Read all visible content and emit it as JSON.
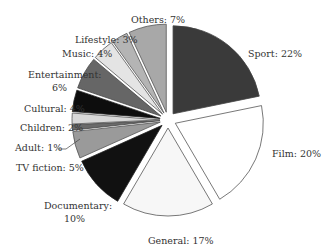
{
  "chart_data": {
    "type": "pie",
    "title": "",
    "exploded": true,
    "start_angle_deg": 0,
    "direction": "clockwise",
    "slices": [
      {
        "label": "Sport",
        "value": 22,
        "text": "Sport: 22%",
        "color": "#3a3a3a",
        "stroke": "#444444"
      },
      {
        "label": "Film",
        "value": 20,
        "text": "Film: 20%",
        "color": "#ffffff",
        "stroke": "#555555"
      },
      {
        "label": "General",
        "value": 17,
        "text": "General: 17%",
        "color": "#f7f7f7",
        "stroke": "#555555"
      },
      {
        "label": "Documentary",
        "value": 10,
        "text": "Documentary: 10%",
        "color": "#111111",
        "stroke": "#222222"
      },
      {
        "label": "TV fiction",
        "value": 5,
        "text": "TV fiction: 5%",
        "color": "#9a9a9a",
        "stroke": "#555555"
      },
      {
        "label": "Adult",
        "value": 1,
        "text": "Adult: 1%",
        "color": "#6a6a6a",
        "stroke": "#444444"
      },
      {
        "label": "Children",
        "value": 2,
        "text": "Children: 2%",
        "color": "#d8d8d8",
        "stroke": "#555555"
      },
      {
        "label": "Cultural",
        "value": 4,
        "text": "Cultural: 4%",
        "color": "#0d0d0d",
        "stroke": "#222222"
      },
      {
        "label": "Entertainment",
        "value": 6,
        "text": "Entertainment: 6%",
        "color": "#666666",
        "stroke": "#444444"
      },
      {
        "label": "Music",
        "value": 4,
        "text": "Music: 4%",
        "color": "#e4e4e4",
        "stroke": "#555555"
      },
      {
        "label": "Lifestyle",
        "value": 3,
        "text": "Lifestyle: 3%",
        "color": "#b4b4b4",
        "stroke": "#555555"
      },
      {
        "label": "Others",
        "value": 7,
        "text": "Others: 7%",
        "color": "#a8a8a8",
        "stroke": "#555555"
      }
    ],
    "labels_text": {
      "sport": "Sport: 22%",
      "film": "Film: 20%",
      "general": "General: 17%",
      "documentary_1": "Documentary:",
      "documentary_2": "10%",
      "tv_fiction": "TV fiction: 5%",
      "adult": "Adult: 1%",
      "children": "Children: 2%",
      "cultural": "Cultural: 4%",
      "entertainment_1": "Entertainment:",
      "entertainment_2": "6%",
      "music": "Music: 4%",
      "lifestyle": "Lifestyle: 3%",
      "others": "Others: 7%"
    },
    "legend": "none (inline labels)"
  }
}
